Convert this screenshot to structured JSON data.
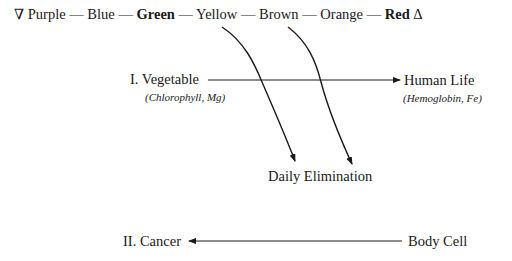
{
  "spectrum": {
    "start_symbol": "∇",
    "end_symbol": "Δ",
    "separator": "—",
    "colors": [
      {
        "label": "Purple",
        "bold": false
      },
      {
        "label": "Blue",
        "bold": false
      },
      {
        "label": "Green",
        "bold": true
      },
      {
        "label": "Yellow",
        "bold": false
      },
      {
        "label": "Brown",
        "bold": false
      },
      {
        "label": "Orange",
        "bold": false
      },
      {
        "label": "Red",
        "bold": true
      }
    ]
  },
  "nodes": {
    "vegetable": {
      "label": "I. Vegetable",
      "sub": "(Chlorophyll, Mg)"
    },
    "human_life": {
      "label": "Human Life",
      "sub": "(Hemoglobin, Fe)"
    },
    "daily_elimination": {
      "label": "Daily Elimination"
    },
    "cancer": {
      "label": "II. Cancer"
    },
    "body_cell": {
      "label": "Body Cell"
    }
  },
  "edges": [
    {
      "from": "vegetable",
      "to": "human_life"
    },
    {
      "from": "Yellow",
      "to": "daily_elimination"
    },
    {
      "from": "Brown",
      "to": "daily_elimination"
    },
    {
      "from": "body_cell",
      "to": "cancer"
    }
  ]
}
